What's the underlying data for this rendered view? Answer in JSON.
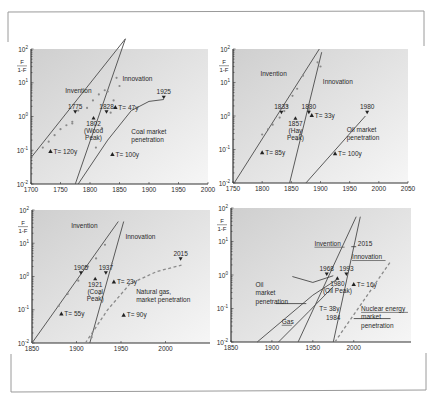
{
  "figure": {
    "frame_color": "#9a9a9a",
    "plot_bg_top": "#d2d2d2",
    "plot_bg_bottom": "#f4f4f4",
    "line_color": "#5a5a5a",
    "text_color": "#2a2a2a",
    "y_axis_label_num": "F",
    "y_axis_label_den": "1-F"
  },
  "chart_data": [
    {
      "id": "wood-coal",
      "type": "line",
      "title": "",
      "xlabel": "",
      "ylabel": "F/(1-F)",
      "yscale": "log",
      "ylim": [
        0.01,
        100
      ],
      "xlim": [
        1700,
        2000
      ],
      "x_ticks": [
        1700,
        1750,
        1800,
        1850,
        1900,
        1950,
        2000
      ],
      "y_ticks": [
        "10^2",
        "10^1",
        "10^0",
        "10^-1",
        "10^-2"
      ],
      "box": {
        "x0": 31,
        "x1": 208,
        "y_top": 49,
        "y_bot": 184
      },
      "series": [
        {
          "name": "Invention",
          "style": "solid",
          "points": [
            [
              1700,
              0.06
            ],
            [
              1860,
              200
            ]
          ]
        },
        {
          "name": "Innovation",
          "style": "solid",
          "points": [
            [
              1775,
              0.01
            ],
            [
              1860,
              200
            ]
          ]
        },
        {
          "name": "Coal market penetration",
          "style": "solid",
          "points": [
            [
              1780,
              0.01
            ],
            [
              1830,
              0.2
            ],
            [
              1870,
              1.5
            ],
            [
              1900,
              2.8
            ],
            [
              1925,
              3.2
            ]
          ]
        }
      ],
      "scatter": [
        [
          1720,
          0.12
        ],
        [
          1730,
          0.18
        ],
        [
          1740,
          0.28
        ],
        [
          1750,
          0.42
        ],
        [
          1760,
          0.55
        ],
        [
          1770,
          0.62
        ],
        [
          1780,
          1.5
        ],
        [
          1795,
          1.8
        ],
        [
          1805,
          3.0
        ],
        [
          1815,
          4.5
        ],
        [
          1825,
          6.0
        ],
        [
          1830,
          5.5
        ],
        [
          1845,
          14
        ],
        [
          1770,
          0.7
        ],
        [
          1810,
          0.12
        ],
        [
          1820,
          0.45
        ],
        [
          1835,
          1.3
        ],
        [
          1840,
          3.0
        ],
        [
          1850,
          8.0
        ]
      ],
      "markers": [
        {
          "label": "1775",
          "x": 1775,
          "y": 1.3,
          "kind": "down"
        },
        {
          "label": "1828",
          "x": 1828,
          "y": 1.3,
          "kind": "down"
        },
        {
          "label": "1925",
          "x": 1925,
          "y": 3.5,
          "kind": "down"
        },
        {
          "label": "1802",
          "x": 1806,
          "y": 0.9,
          "kind": "up",
          "note": [
            "1802",
            "(Wood",
            "Peak)"
          ]
        }
      ],
      "annotations": [
        {
          "text": "Invention",
          "x": 1758,
          "y": 5.0
        },
        {
          "text": "Innovation",
          "x": 1855,
          "y": 11.0
        },
        {
          "text": "T= 47y",
          "x": 1843,
          "y": 1.6,
          "tri": true
        },
        {
          "text": "T= 120y",
          "x": 1733,
          "y": 0.08,
          "tri": true
        },
        {
          "text": "T= 100y",
          "x": 1838,
          "y": 0.065,
          "tri": true
        },
        {
          "text": "Coal market",
          "x": 1870,
          "y": 0.3
        },
        {
          "text": "penetration",
          "x": 1870,
          "y": 0.17
        }
      ]
    },
    {
      "id": "hay-oil",
      "type": "line",
      "title": "",
      "xlabel": "",
      "ylabel": "F/(1-F)",
      "yscale": "log",
      "ylim": [
        0.01,
        100
      ],
      "xlim": [
        1750,
        2050
      ],
      "x_ticks": [
        1750,
        1800,
        1850,
        1900,
        1950,
        2000,
        2050
      ],
      "y_ticks": [
        "10^2",
        "10^1",
        "10^0",
        "10^-1",
        "10^-2"
      ],
      "box": {
        "x0": 233,
        "x1": 408,
        "y_top": 49,
        "y_bot": 183
      },
      "series": [
        {
          "name": "Invention",
          "style": "solid",
          "points": [
            [
              1752,
              0.01
            ],
            [
              1898,
              100
            ]
          ]
        },
        {
          "name": "Innovation",
          "style": "solid",
          "points": [
            [
              1847,
              0.01
            ],
            [
              1902,
              80
            ]
          ]
        },
        {
          "name": "Oil market penetration",
          "style": "solid",
          "points": [
            [
              1875,
              0.01
            ],
            [
              1977,
              1.0
            ]
          ]
        }
      ],
      "scatter": [
        [
          1800,
          0.28
        ],
        [
          1810,
          0.4
        ],
        [
          1818,
          0.55
        ],
        [
          1830,
          0.9
        ],
        [
          1838,
          1.4
        ],
        [
          1843,
          2.0
        ],
        [
          1852,
          4.0
        ],
        [
          1860,
          6.5
        ],
        [
          1870,
          16
        ],
        [
          1860,
          0.2
        ],
        [
          1865,
          0.28
        ],
        [
          1880,
          1.5
        ],
        [
          1895,
          40
        ],
        [
          1900,
          30
        ]
      ],
      "markers": [
        {
          "label": "1833",
          "x": 1833,
          "y": 1.2,
          "kind": "down"
        },
        {
          "label": "1880",
          "x": 1880,
          "y": 1.2,
          "kind": "down"
        },
        {
          "label": "1980",
          "x": 1980,
          "y": 1.2,
          "kind": "down"
        },
        {
          "label": "1857",
          "x": 1857,
          "y": 0.85,
          "kind": "up",
          "note": [
            "1857",
            "(Hay",
            "Peak)"
          ]
        }
      ],
      "annotations": [
        {
          "text": "Invention",
          "x": 1797,
          "y": 16
        },
        {
          "text": "Innovation",
          "x": 1904,
          "y": 9.0
        },
        {
          "text": "T= 33y",
          "x": 1885,
          "y": 0.9,
          "tri": true
        },
        {
          "text": "T= 85y",
          "x": 1800,
          "y": 0.07,
          "tri": true
        },
        {
          "text": "T= 100y",
          "x": 1925,
          "y": 0.065,
          "tri": true
        },
        {
          "text": "Oil market",
          "x": 1945,
          "y": 0.33
        },
        {
          "text": "penetration",
          "x": 1945,
          "y": 0.19
        }
      ]
    },
    {
      "id": "coal-gas",
      "type": "line",
      "title": "",
      "xlabel": "",
      "ylabel": "F/(1-F)",
      "yscale": "log",
      "ylim": [
        0.01,
        100
      ],
      "xlim": [
        1850,
        2050
      ],
      "x_ticks": [
        1850,
        1900,
        1950,
        2000
      ],
      "y_ticks": [
        "10^2",
        "10^1",
        "10^0",
        "10^-1",
        "10^-2"
      ],
      "box": {
        "x0": 32,
        "x1": 210,
        "y_top": 210,
        "y_bot": 343
      },
      "series": [
        {
          "name": "Invention",
          "style": "solid",
          "points": [
            [
              1850,
              0.01
            ],
            [
              1947,
              45
            ]
          ]
        },
        {
          "name": "Innovation",
          "style": "solid",
          "points": [
            [
              1915,
              0.01
            ],
            [
              1953,
              45
            ]
          ]
        },
        {
          "name": "Natural gas market penetration",
          "style": "dashed",
          "points": [
            [
              1910,
              0.01
            ],
            [
              1935,
              0.1
            ],
            [
              1960,
              0.6
            ],
            [
              1990,
              1.4
            ],
            [
              2018,
              2.2
            ]
          ]
        }
      ],
      "scatter": [
        [
          1880,
          0.13
        ],
        [
          1890,
          0.3
        ],
        [
          1902,
          0.75
        ],
        [
          1913,
          2.0
        ],
        [
          1922,
          3.5
        ],
        [
          1932,
          9.0
        ],
        [
          1917,
          0.015
        ],
        [
          1926,
          0.3
        ],
        [
          1940,
          2.5
        ]
      ],
      "markers": [
        {
          "label": "1905",
          "x": 1905,
          "y": 1.2,
          "kind": "down"
        },
        {
          "label": "1937",
          "x": 1933,
          "y": 1.2,
          "kind": "down"
        },
        {
          "label": "2015",
          "x": 2017,
          "y": 3.2,
          "kind": "down"
        },
        {
          "label": "1921",
          "x": 1921,
          "y": 0.85,
          "kind": "up",
          "note": [
            "1921",
            "(Coal",
            "Peak)"
          ]
        }
      ],
      "annotations": [
        {
          "text": "Invention",
          "x": 1894,
          "y": 28
        },
        {
          "text": "Innovation",
          "x": 1955,
          "y": 13
        },
        {
          "text": "T= 23y",
          "x": 1942,
          "y": 0.6,
          "tri": true
        },
        {
          "text": "T= 55y",
          "x": 1883,
          "y": 0.065,
          "tri": true
        },
        {
          "text": "T= 90y",
          "x": 1953,
          "y": 0.06,
          "tri": true
        },
        {
          "text": "Natural gas,",
          "x": 1967,
          "y": 0.3
        },
        {
          "text": "market penetration",
          "x": 1967,
          "y": 0.17
        }
      ]
    },
    {
      "id": "oil-nuclear",
      "type": "line",
      "title": "",
      "xlabel": "",
      "ylabel": "F/(1-F)",
      "yscale": "log",
      "ylim": [
        0.01,
        100
      ],
      "xlim": [
        1850,
        2070
      ],
      "x_ticks": [
        1850,
        1900,
        1950,
        2000
      ],
      "y_ticks": [
        "10^2",
        "10^1",
        "10^0",
        "10^-1",
        "10^-2"
      ],
      "box": {
        "x0": 231,
        "x1": 411,
        "y_top": 208,
        "y_bot": 342
      },
      "series": [
        {
          "name": "Invention",
          "style": "solid",
          "points": [
            [
              1932,
              0.01
            ],
            [
              2003,
              55
            ]
          ]
        },
        {
          "name": "Innovation",
          "style": "solid",
          "points": [
            [
              1975,
              0.01
            ],
            [
              2008,
              55
            ]
          ]
        },
        {
          "name": "Oil market penetration",
          "style": "solid",
          "points": [
            [
              1882,
              0.01
            ],
            [
              1950,
              0.25
            ],
            [
              1980,
              0.75
            ]
          ]
        },
        {
          "name": "Gas",
          "style": "solid",
          "points": [
            [
              1908,
              0.01
            ],
            [
              1945,
              0.08
            ],
            [
              1975,
              0.45
            ]
          ]
        },
        {
          "name": "Nuclear energy market penetration",
          "style": "dashed",
          "points": [
            [
              1977,
              0.01
            ],
            [
              2045,
              2.5
            ]
          ]
        }
      ],
      "scatter": [],
      "markers": [
        {
          "label": "1968",
          "x": 1967,
          "y": 1.0,
          "kind": "down"
        },
        {
          "label": "1993",
          "x": 1991,
          "y": 1.0,
          "kind": "down"
        },
        {
          "label": "1980",
          "x": 1980,
          "y": 0.8,
          "kind": "up",
          "note": [
            "1980",
            "(Oil Peak)"
          ]
        }
      ],
      "annotations": [
        {
          "text": "Invention",
          "x": 1952,
          "y": 7.5,
          "underline": true
        },
        {
          "text": "2015",
          "x": 2005,
          "y": 7.5
        },
        {
          "text": "Innovation",
          "x": 1998,
          "y": 3.0,
          "underline": true
        },
        {
          "text": "T= 16y",
          "x": 2000,
          "y": 0.45,
          "tri": true
        },
        {
          "text": "T= 38y",
          "x": 1958,
          "y": 0.085
        },
        {
          "text": "1984",
          "x": 1966,
          "y": 0.045
        },
        {
          "text": "Oil",
          "x": 1880,
          "y": 0.45
        },
        {
          "text": "market",
          "x": 1880,
          "y": 0.25
        },
        {
          "text": "penetration",
          "x": 1880,
          "y": 0.14
        },
        {
          "text": "Gas",
          "x": 1912,
          "y": 0.035,
          "underline": true
        },
        {
          "text": "Nuclear energy",
          "x": 2009,
          "y": 0.085,
          "underline": true
        },
        {
          "text": "market",
          "x": 2009,
          "y": 0.048
        },
        {
          "text": "penetration",
          "x": 2009,
          "y": 0.027
        }
      ],
      "leaders": [
        {
          "from": [
            1975,
            0.95
          ],
          "via": [
            1950,
            0.6
          ],
          "to": [
            1925,
            0.9
          ]
        },
        {
          "from": [
            1905,
            0.14
          ],
          "to": [
            1942,
            0.14
          ]
        },
        {
          "from": [
            2000,
            0.05
          ],
          "to": [
            2045,
            0.05
          ]
        },
        {
          "from": [
            1997,
            7.0
          ],
          "to": [
            2003,
            7.0
          ]
        }
      ]
    }
  ]
}
